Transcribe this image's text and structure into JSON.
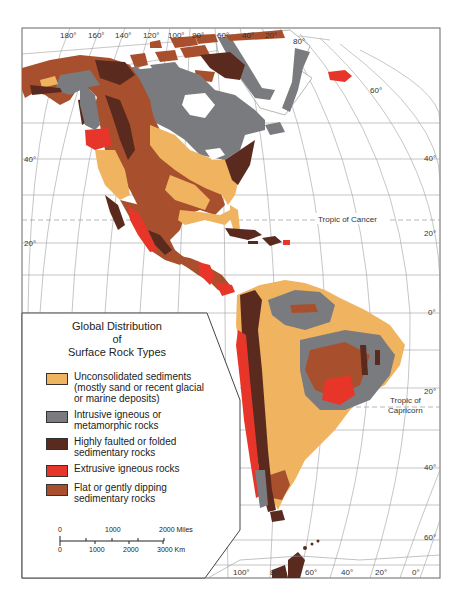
{
  "legend": {
    "title_lines": [
      "Global Distribution",
      "of",
      "Surface Rock Types"
    ],
    "items": [
      {
        "id": "unconsolidated",
        "lines": [
          "Unconsolidated sediments",
          "(mostly sand or recent glacial",
          "or marine deposits)"
        ],
        "color": "#F0B461"
      },
      {
        "id": "intrusive",
        "lines": [
          "Intrusive igneous or",
          "metamorphic rocks"
        ],
        "color": "#7A7B7E"
      },
      {
        "id": "faulted",
        "lines": [
          "Highly faulted or folded",
          "sedimentary rocks"
        ],
        "color": "#5A2A1E"
      },
      {
        "id": "extrusive",
        "lines": [
          "Extrusive igneous rocks"
        ],
        "color": "#E8352A"
      },
      {
        "id": "flat",
        "lines": [
          "Flat or gently dipping",
          "sedimentary rocks"
        ],
        "color": "#A8502E"
      }
    ]
  },
  "scale_bar": {
    "miles_labels": [
      "0",
      "1000",
      "2000 Miles"
    ],
    "km_labels": [
      "0",
      "1000",
      "2000",
      "3000 Km"
    ]
  },
  "graticule": {
    "top_longitudes": [
      "180°",
      "160°",
      "140°",
      "120°",
      "100°",
      "80°",
      "60°",
      "40°",
      "20°"
    ],
    "bottom_longitudes": [
      "100°",
      "80°",
      "60°",
      "40°",
      "20°",
      "0°"
    ],
    "left_latitudes": [
      "40°",
      "20°"
    ],
    "right_latitudes": [
      "80°",
      "60°",
      "40°",
      "20°",
      "0°",
      "20°",
      "40°",
      "60°"
    ]
  },
  "annotations": {
    "tropic_cancer": "Tropic of Cancer",
    "tropic_capricorn_line1": "Tropic of",
    "tropic_capricorn_line2": "Capricorn"
  },
  "colors": {
    "unconsolidated": "#F0B461",
    "intrusive": "#7A7B7E",
    "faulted": "#5A2A1E",
    "extrusive": "#E8352A",
    "flat": "#A8502E",
    "grid": "#9a9a9a",
    "frame": "#555555"
  }
}
